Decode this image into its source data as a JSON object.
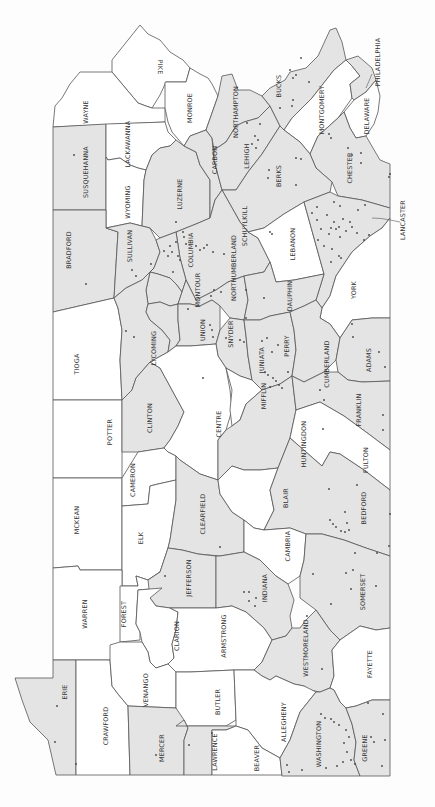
{
  "map": {
    "title": "Pennsylvania counties",
    "orientation": "rotated 90 degrees clockwise (north at left)",
    "colors": {
      "shaded": "#e4e4e4",
      "plain": "#ffffff",
      "border": "#555555",
      "dot": "#444444"
    },
    "counties": {
      "pike": {
        "label": "PIKE",
        "shaded": false
      },
      "wayne": {
        "label": "WAYNE",
        "shaded": false
      },
      "monroe": {
        "label": "MONROE",
        "shaded": false
      },
      "susquehanna": {
        "label": "SUSQUEHANNA",
        "shaded": true
      },
      "lackawanna": {
        "label": "LACKAWANNA",
        "shaded": false
      },
      "wyoming": {
        "label": "WYOMING",
        "shaded": false
      },
      "luzerne": {
        "label": "LUZERNE",
        "shaded": true
      },
      "carbon": {
        "label": "CARBON",
        "shaded": true
      },
      "northampton": {
        "label": "NORTHAMPTON",
        "shaded": true
      },
      "lehigh": {
        "label": "LEHIGH",
        "shaded": true
      },
      "bucks": {
        "label": "BUCKS",
        "shaded": true
      },
      "montgomery": {
        "label": "MONTGOMERY",
        "shaded": false
      },
      "philadelphia": {
        "label": "PHILADELPHIA",
        "shaded": true
      },
      "delaware": {
        "label": "DELAWARE",
        "shaded": false
      },
      "chester": {
        "label": "CHESTER",
        "shaded": true
      },
      "berks": {
        "label": "BERKS",
        "shaded": true
      },
      "schuylkill": {
        "label": "SCHUYLKILL",
        "shaded": true
      },
      "lebanon": {
        "label": "LEBANON",
        "shaded": false
      },
      "lancaster": {
        "label": "LANCASTER",
        "shaded": true
      },
      "york": {
        "label": "YORK",
        "shaded": false
      },
      "bradford": {
        "label": "BRADFORD",
        "shaded": true
      },
      "sullivan": {
        "label": "SULLIVAN",
        "shaded": true
      },
      "columbia": {
        "label": "COLUMBIA",
        "shaded": true
      },
      "montour": {
        "label": "MONTOUR",
        "shaded": true
      },
      "northumberland": {
        "label": "NORTHUMBERLAND",
        "shaded": true
      },
      "dauphin": {
        "label": "DAUPHIN",
        "shaded": true
      },
      "tioga": {
        "label": "TIOGA",
        "shaded": false
      },
      "lycoming": {
        "label": "LYCOMING",
        "shaded": true
      },
      "union": {
        "label": "UNION",
        "shaded": true
      },
      "snyder": {
        "label": "SNYDER",
        "shaded": true
      },
      "juniata": {
        "label": "JUNIATA",
        "shaded": true
      },
      "perry": {
        "label": "PERRY",
        "shaded": true
      },
      "cumberland": {
        "label": "CUMBERLAND",
        "shaded": true
      },
      "adams": {
        "label": "ADAMS",
        "shaded": true
      },
      "potter": {
        "label": "POTTER",
        "shaded": false
      },
      "clinton": {
        "label": "CLINTON",
        "shaded": true
      },
      "centre": {
        "label": "CENTRE",
        "shaded": false
      },
      "mifflin": {
        "label": "MIFFLIN",
        "shaded": false
      },
      "huntingdon": {
        "label": "HUNTINGDON",
        "shaded": true
      },
      "franklin": {
        "label": "FRANKLIN",
        "shaded": true
      },
      "fulton": {
        "label": "FULTON",
        "shaded": false
      },
      "mckean": {
        "label": "MCKEAN",
        "shaded": false
      },
      "cameron": {
        "label": "CAMERON",
        "shaded": false
      },
      "elk": {
        "label": "ELK",
        "shaded": false
      },
      "clearfield": {
        "label": "CLEARFIELD",
        "shaded": true
      },
      "blair": {
        "label": "BLAIR",
        "shaded": false
      },
      "bedford": {
        "label": "BEDFORD",
        "shaded": true
      },
      "cambria": {
        "label": "CAMBRIA",
        "shaded": false
      },
      "somerset": {
        "label": "SOMERSET",
        "shaded": true
      },
      "warren": {
        "label": "WARREN",
        "shaded": false
      },
      "forest": {
        "label": "FOREST",
        "shaded": false
      },
      "jefferson": {
        "label": "JEFFERSON",
        "shaded": true
      },
      "indiana": {
        "label": "INDIANA",
        "shaded": true
      },
      "clarion": {
        "label": "CLARION",
        "shaded": false
      },
      "armstrong": {
        "label": "ARMSTRONG",
        "shaded": false
      },
      "westmoreland": {
        "label": "WESTMORELAND",
        "shaded": true
      },
      "fayette": {
        "label": "FAYETTE",
        "shaded": false
      },
      "erie": {
        "label": "ERIE",
        "shaded": true
      },
      "crawford": {
        "label": "CRAWFORD",
        "shaded": false
      },
      "venango": {
        "label": "VENANGO",
        "shaded": false
      },
      "butler": {
        "label": "BUTLER",
        "shaded": false
      },
      "allegheny": {
        "label": "ALLEGHENY",
        "shaded": false
      },
      "mercer": {
        "label": "MERCER",
        "shaded": true
      },
      "lawrence": {
        "label": "LAWRENCE",
        "shaded": true
      },
      "beaver": {
        "label": "BEAVER",
        "shaded": false
      },
      "washington": {
        "label": "WASHINGTON",
        "shaded": true
      },
      "greene": {
        "label": "GREENE",
        "shaded": true
      }
    }
  }
}
